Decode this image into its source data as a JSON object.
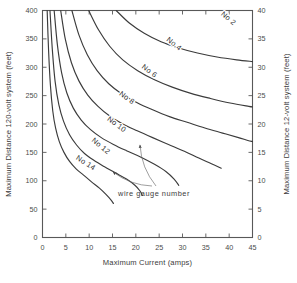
{
  "chart_data": {
    "type": "line",
    "title": "",
    "xlabel": "Maximum Current (amps)",
    "ylabel": "Maximum Distance  120-volt system (feet)",
    "y2label": "Maximum Distance  12-volt system (feet)",
    "xlim": [
      0,
      45
    ],
    "ylim": [
      0,
      400
    ],
    "y2lim": [
      0,
      40
    ],
    "xticks": [
      "0",
      "5",
      "10",
      "15",
      "20",
      "25",
      "30",
      "35",
      "40",
      "45"
    ],
    "xtick_values": [
      0,
      5,
      10,
      15,
      20,
      25,
      30,
      35,
      40,
      45
    ],
    "yticks": [
      "0",
      "50",
      "100",
      "150",
      "200",
      "250",
      "300",
      "350",
      "400"
    ],
    "ytick_values": [
      0,
      50,
      100,
      150,
      200,
      250,
      300,
      350,
      400
    ],
    "y2ticks": [
      "0",
      "5",
      "10",
      "15",
      "20",
      "25",
      "30",
      "35",
      "40"
    ],
    "y2tick_values": [
      0,
      5,
      10,
      15,
      20,
      25,
      30,
      35,
      40
    ],
    "grid": false,
    "legend": "none",
    "annotation": "wire gauge number",
    "series": [
      {
        "name": "No 14",
        "label": "No 14",
        "label_x": 9.0,
        "label_y": 128,
        "label_rotation": 33,
        "points": [
          [
            1.0,
            400
          ],
          [
            1.3,
            330
          ],
          [
            1.7,
            268
          ],
          [
            2.2,
            223
          ],
          [
            2.8,
            193
          ],
          [
            3.6,
            169
          ],
          [
            4.6,
            150
          ],
          [
            5.8,
            134
          ],
          [
            7.2,
            121
          ],
          [
            8.8,
            110
          ],
          [
            10.5,
            98
          ],
          [
            12.2,
            87
          ],
          [
            13.6,
            76
          ],
          [
            14.7,
            66
          ],
          [
            15.2,
            60
          ]
        ]
      },
      {
        "name": "No 12",
        "label": "No 12",
        "label_x": 12.2,
        "label_y": 158,
        "label_rotation": 40,
        "points": [
          [
            1.6,
            400
          ],
          [
            2.1,
            332
          ],
          [
            2.7,
            275
          ],
          [
            3.5,
            234
          ],
          [
            4.5,
            205
          ],
          [
            5.8,
            181
          ],
          [
            7.3,
            163
          ],
          [
            9.0,
            148
          ],
          [
            11.0,
            136
          ],
          [
            13.2,
            125
          ],
          [
            15.6,
            114
          ],
          [
            18.0,
            103
          ],
          [
            19.8,
            92
          ],
          [
            20.9,
            82
          ],
          [
            21.4,
            74
          ]
        ]
      },
      {
        "name": "No 10",
        "label": "No 10",
        "label_x": 15.6,
        "label_y": 196,
        "label_rotation": 36,
        "points": [
          [
            2.5,
            400
          ],
          [
            3.2,
            339
          ],
          [
            4.1,
            290
          ],
          [
            5.2,
            255
          ],
          [
            6.6,
            228
          ],
          [
            8.3,
            207
          ],
          [
            10.3,
            190
          ],
          [
            12.6,
            176
          ],
          [
            15.2,
            164
          ],
          [
            18.0,
            153
          ],
          [
            21.0,
            142
          ],
          [
            24.0,
            129
          ],
          [
            26.5,
            116
          ],
          [
            28.2,
            103
          ],
          [
            29.2,
            92
          ]
        ]
      },
      {
        "name": "No 8",
        "label": "No 8",
        "label_x": 17.8,
        "label_y": 243,
        "label_rotation": 36,
        "points": [
          [
            3.9,
            400
          ],
          [
            4.9,
            349
          ],
          [
            6.2,
            308
          ],
          [
            7.8,
            276
          ],
          [
            9.7,
            251
          ],
          [
            11.9,
            231
          ],
          [
            14.4,
            214
          ],
          [
            17.2,
            200
          ],
          [
            20.3,
            188
          ],
          [
            23.6,
            176
          ],
          [
            27.0,
            164
          ],
          [
            30.4,
            152
          ],
          [
            33.5,
            140
          ],
          [
            36.2,
            130
          ],
          [
            38.3,
            122
          ]
        ]
      },
      {
        "name": "No 6",
        "label": "No 6",
        "label_x": 22.6,
        "label_y": 290,
        "label_rotation": 37,
        "points": [
          [
            6.3,
            400
          ],
          [
            7.8,
            357
          ],
          [
            9.6,
            322
          ],
          [
            11.7,
            294
          ],
          [
            14.2,
            271
          ],
          [
            17.0,
            253
          ],
          [
            20.2,
            238
          ],
          [
            23.6,
            225
          ],
          [
            27.2,
            213
          ],
          [
            31.0,
            203
          ],
          [
            34.8,
            193
          ],
          [
            38.6,
            184
          ],
          [
            42.0,
            176
          ],
          [
            44.0,
            171
          ],
          [
            45.0,
            169
          ]
        ]
      },
      {
        "name": "No 4",
        "label": "No 4",
        "label_x": 27.9,
        "label_y": 338,
        "label_rotation": 38,
        "points": [
          [
            9.9,
            400
          ],
          [
            12.0,
            366
          ],
          [
            14.4,
            337
          ],
          [
            17.2,
            313
          ],
          [
            20.4,
            294
          ],
          [
            24.0,
            278
          ],
          [
            27.8,
            265
          ],
          [
            31.8,
            254
          ],
          [
            36.0,
            245
          ],
          [
            40.2,
            237
          ],
          [
            44.2,
            231
          ],
          [
            45.0,
            230
          ]
        ]
      },
      {
        "name": "No 2",
        "label": "No 2",
        "label_x": 39.5,
        "label_y": 383,
        "label_rotation": 40,
        "points": [
          [
            15.8,
            400
          ],
          [
            18.6,
            378
          ],
          [
            21.8,
            360
          ],
          [
            25.4,
            345
          ],
          [
            29.2,
            334
          ],
          [
            33.2,
            325
          ],
          [
            37.4,
            318
          ],
          [
            41.6,
            313
          ],
          [
            45.0,
            310
          ]
        ]
      }
    ]
  },
  "annotation_block": {
    "text": "wire gauge number",
    "text_x": 154,
    "text_y": 196,
    "arrows": [
      {
        "name": "arrow-to-no10",
        "from": [
          152,
          186
        ],
        "to": [
          113,
          172
        ]
      },
      {
        "name": "arrow-to-no8",
        "from": [
          156,
          186
        ],
        "to": [
          140,
          145
        ]
      }
    ]
  }
}
